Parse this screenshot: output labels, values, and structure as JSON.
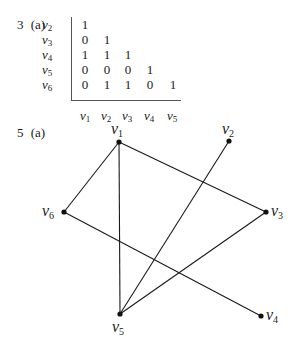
{
  "problem3": {
    "number": "3",
    "part": "(a)",
    "row_labels": [
      {
        "v": "v",
        "sub": "2"
      },
      {
        "v": "v",
        "sub": "3"
      },
      {
        "v": "v",
        "sub": "4"
      },
      {
        "v": "v",
        "sub": "5"
      },
      {
        "v": "v",
        "sub": "6"
      }
    ],
    "column_labels": [
      {
        "v": "v",
        "sub": "1"
      },
      {
        "v": "v",
        "sub": "2"
      },
      {
        "v": "v",
        "sub": "3"
      },
      {
        "v": "v",
        "sub": "4"
      },
      {
        "v": "v",
        "sub": "5"
      }
    ],
    "matrix": [
      [
        "1"
      ],
      [
        "0",
        "1"
      ],
      [
        "1",
        "1",
        "1"
      ],
      [
        "0",
        "0",
        "0",
        "1"
      ],
      [
        "0",
        "1",
        "1",
        "0",
        "1"
      ]
    ]
  },
  "problem5": {
    "number": "5",
    "part": "(a)",
    "nodes": [
      {
        "id": "v1",
        "v": "v",
        "sub": "1",
        "x": 119,
        "y": 142
      },
      {
        "id": "v2",
        "v": "v",
        "sub": "2",
        "x": 229,
        "y": 141
      },
      {
        "id": "v3",
        "v": "v",
        "sub": "3",
        "x": 266,
        "y": 212
      },
      {
        "id": "v4",
        "v": "v",
        "sub": "4",
        "x": 261,
        "y": 316
      },
      {
        "id": "v5",
        "v": "v",
        "sub": "5",
        "x": 120,
        "y": 314
      },
      {
        "id": "v6",
        "v": "v",
        "sub": "6",
        "x": 64,
        "y": 212
      }
    ],
    "edges": [
      [
        "v1",
        "v6"
      ],
      [
        "v1",
        "v3"
      ],
      [
        "v1",
        "v5"
      ],
      [
        "v6",
        "v4"
      ],
      [
        "v2",
        "v5"
      ],
      [
        "v3",
        "v5"
      ]
    ]
  }
}
